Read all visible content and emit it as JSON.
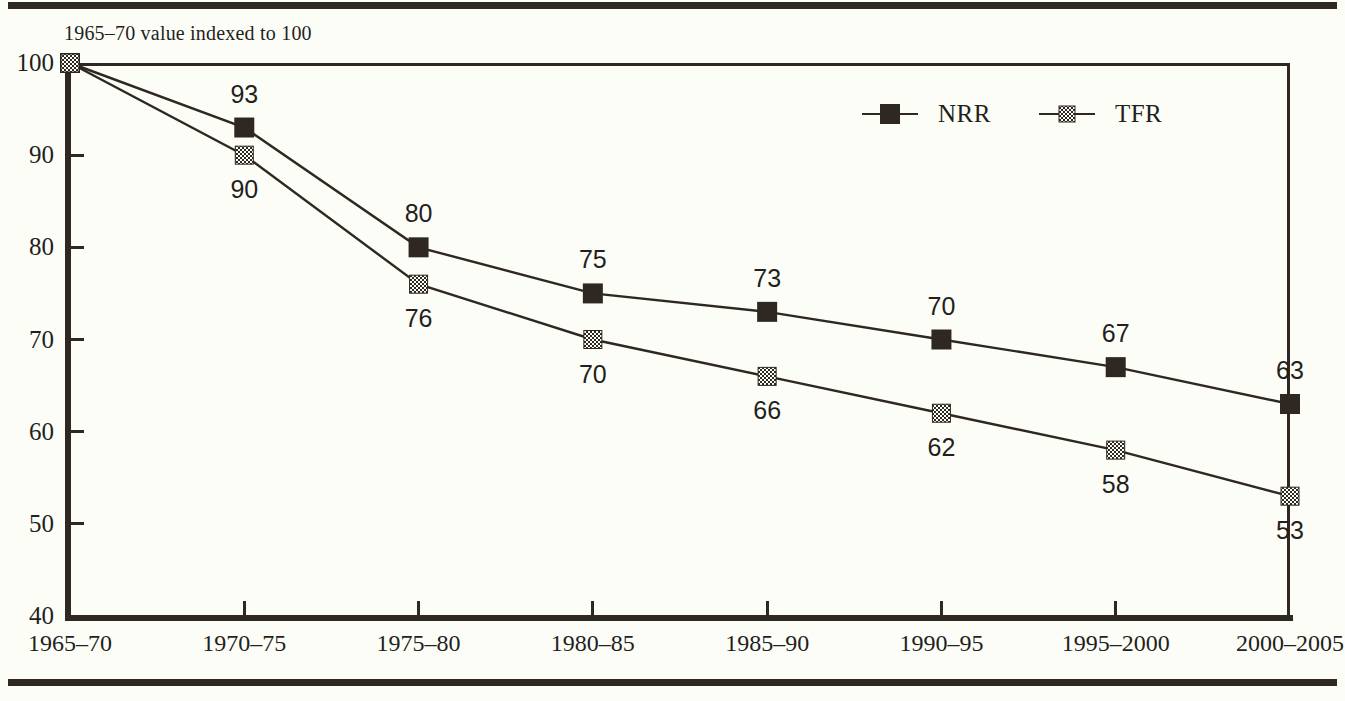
{
  "subtitle": "1965–70 value indexed to 100",
  "axis_title_x": "Year",
  "legend": {
    "items": [
      {
        "label": "NRR",
        "marker": "filled-square",
        "color": "#2e2722"
      },
      {
        "label": "TFR",
        "marker": "checkered-square",
        "color": "#2e2722"
      }
    ]
  },
  "chart_data": {
    "type": "line",
    "title": "",
    "subtitle": "1965–70 value indexed to 100",
    "xlabel": "Year",
    "ylabel": "",
    "categories": [
      "1965–70",
      "1970–75",
      "1975–80",
      "1980–85",
      "1985–90",
      "1990–95",
      "1995–2000",
      "2000–2005"
    ],
    "series": [
      {
        "name": "NRR",
        "values": [
          100,
          93,
          80,
          75,
          73,
          70,
          67,
          63
        ],
        "marker": "filled-square",
        "label_positions": [
          "none",
          "above",
          "above",
          "above",
          "above",
          "above",
          "above",
          "above"
        ]
      },
      {
        "name": "TFR",
        "values": [
          100,
          90,
          76,
          70,
          66,
          62,
          58,
          53
        ],
        "marker": "checkered-square",
        "label_positions": [
          "none",
          "below",
          "below",
          "below",
          "below",
          "below",
          "below",
          "below"
        ]
      }
    ],
    "ylim": [
      40,
      100
    ],
    "yticks": [
      40,
      50,
      60,
      70,
      80,
      90,
      100
    ],
    "ytick_labels": [
      "40",
      "50",
      "60",
      "70",
      "80",
      "90",
      "100"
    ],
    "grid": false,
    "legend_position": "upper right"
  },
  "colors": {
    "ink": "#2e2722",
    "background": "#fdfdf8"
  }
}
